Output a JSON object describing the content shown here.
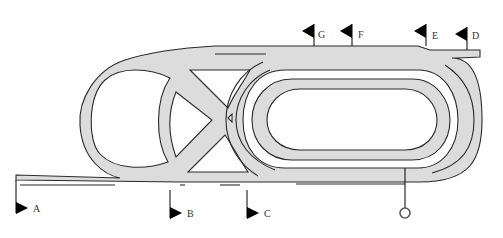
{
  "diagram": {
    "type": "racecourse-layout",
    "colors": {
      "track": "#dcdcdc",
      "outline": "#2a2a2a",
      "flag": "#000000",
      "background": "#ffffff"
    },
    "markers": [
      {
        "id": "A",
        "label": "A",
        "x": 17,
        "y": 208
      },
      {
        "id": "B",
        "label": "B",
        "x": 170,
        "y": 213
      },
      {
        "id": "C",
        "label": "C",
        "x": 247,
        "y": 213
      },
      {
        "id": "D",
        "label": "D",
        "x": 468,
        "y": 35
      },
      {
        "id": "E",
        "label": "E",
        "x": 426,
        "y": 32
      },
      {
        "id": "F",
        "label": "F",
        "x": 352,
        "y": 33
      },
      {
        "id": "G",
        "label": "G",
        "x": 314,
        "y": 33
      }
    ],
    "winning_post": {
      "label": "",
      "x": 405,
      "y": 213
    }
  }
}
